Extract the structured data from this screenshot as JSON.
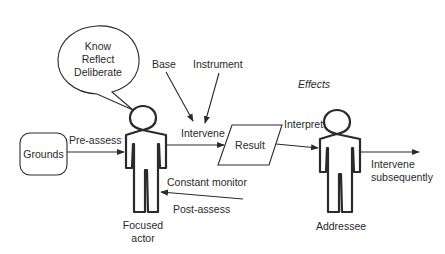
{
  "diagram": {
    "speech_bubble": {
      "lines": [
        "Know",
        "Reflect",
        "Deliberate"
      ]
    },
    "nodes": {
      "grounds": "Grounds",
      "result": "Result",
      "focused_actor": [
        "Focused",
        "actor"
      ],
      "addressee": "Addressee"
    },
    "edge_labels": {
      "pre_assess": "Pre-assess",
      "base": "Base",
      "instrument": "Instrument",
      "intervene": "Intervene",
      "interpret": "Interpret",
      "effects": "Effects",
      "intervene_subsequently": [
        "Intervene",
        "subsequently"
      ],
      "constant_monitor": "Constant monitor",
      "post_assess": "Post-assess"
    },
    "colors": {
      "line": "#2a2a2a",
      "background": "#ffffff"
    }
  }
}
